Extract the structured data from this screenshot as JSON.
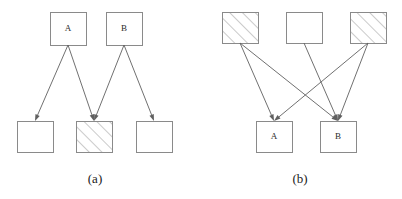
{
  "figure": {
    "background_color": "#ffffff",
    "stroke_color": "#8a8a8a",
    "edge_color": "#606060",
    "text_color": "#1a1a1a",
    "panels": [
      {
        "id": "panel-a",
        "caption": "(a)",
        "nodes": [
          {
            "id": "a-top-A",
            "label": "A",
            "fill": "plain",
            "x": 50,
            "y": 12,
            "w": 36,
            "h": 33
          },
          {
            "id": "a-top-B",
            "label": "B",
            "fill": "plain",
            "x": 106,
            "y": 12,
            "w": 36,
            "h": 33
          },
          {
            "id": "a-bot-left",
            "label": "",
            "fill": "plain",
            "x": 17,
            "y": 121,
            "w": 36,
            "h": 31
          },
          {
            "id": "a-bot-mid",
            "label": "",
            "fill": "hatched",
            "x": 76,
            "y": 121,
            "w": 36,
            "h": 31
          },
          {
            "id": "a-bot-right",
            "label": "",
            "fill": "plain",
            "x": 136,
            "y": 121,
            "w": 36,
            "h": 31
          }
        ],
        "edges": [
          {
            "from": "a-top-A",
            "to": "a-bot-left"
          },
          {
            "from": "a-top-A",
            "to": "a-bot-mid"
          },
          {
            "from": "a-top-B",
            "to": "a-bot-mid"
          },
          {
            "from": "a-top-B",
            "to": "a-bot-right"
          }
        ]
      },
      {
        "id": "panel-b",
        "caption": "(b)",
        "nodes": [
          {
            "id": "b-top-left",
            "label": "",
            "fill": "hatched",
            "x": 222,
            "y": 12,
            "w": 36,
            "h": 31
          },
          {
            "id": "b-top-mid",
            "label": "",
            "fill": "plain",
            "x": 286,
            "y": 12,
            "w": 36,
            "h": 31
          },
          {
            "id": "b-top-right",
            "label": "",
            "fill": "hatched",
            "x": 350,
            "y": 12,
            "w": 36,
            "h": 31
          },
          {
            "id": "b-bot-A",
            "label": "A",
            "fill": "plain",
            "x": 256,
            "y": 121,
            "w": 36,
            "h": 31
          },
          {
            "id": "b-bot-B",
            "label": "B",
            "fill": "plain",
            "x": 320,
            "y": 121,
            "w": 36,
            "h": 31
          }
        ],
        "edges": [
          {
            "from": "b-top-left",
            "to": "b-bot-A"
          },
          {
            "from": "b-top-left",
            "to": "b-bot-B"
          },
          {
            "from": "b-top-mid",
            "to": "b-bot-B"
          },
          {
            "from": "b-top-right",
            "to": "b-bot-A"
          },
          {
            "from": "b-top-right",
            "to": "b-bot-B"
          }
        ]
      }
    ],
    "captions": [
      {
        "text": "(a)",
        "x": 95,
        "y": 183
      },
      {
        "text": "(b)",
        "x": 300,
        "y": 183
      }
    ]
  }
}
